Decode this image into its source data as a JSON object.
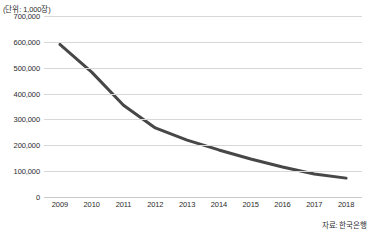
{
  "unit_label": "(단위: 1,000장)",
  "source_note": "자료: 한국은행",
  "style": {
    "line_color": "#474747",
    "grid_color": "#d8d8d8",
    "text_color": "#2b2b2b",
    "background": "#ffffff"
  },
  "chart_data": {
    "type": "line",
    "title": "",
    "subtitle": "",
    "xlabel": "",
    "ylabel": "",
    "unit": "(단위: 1,000장)",
    "source": "자료: 한국은행",
    "categories": [
      "2009",
      "2010",
      "2011",
      "2012",
      "2013",
      "2014",
      "2015",
      "2016",
      "2017",
      "2018"
    ],
    "values": [
      590000,
      483000,
      355000,
      267000,
      220000,
      182000,
      147000,
      116000,
      89000,
      73000
    ],
    "ylim": [
      0,
      700000
    ],
    "ytick_values": [
      0,
      100000,
      200000,
      300000,
      400000,
      500000,
      600000,
      700000
    ],
    "ytick_labels": [
      "0",
      "100,000",
      "200,000",
      "300,000",
      "400,000",
      "500,000",
      "600,000",
      "700,000"
    ],
    "xtick_labels": [
      "2009",
      "2010",
      "2011",
      "2012",
      "2013",
      "2014",
      "2015",
      "2016",
      "2017",
      "2018"
    ],
    "grid": "horizontal",
    "legend": "none",
    "markers": "none",
    "line_width": 3
  }
}
